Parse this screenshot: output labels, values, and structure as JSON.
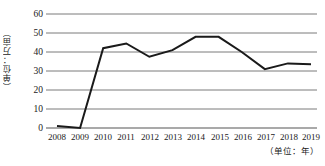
{
  "chart_data": {
    "type": "line",
    "title": "",
    "xlabel": "（单位：年）",
    "ylabel": "（单位：万亩）",
    "categories": [
      "2008",
      "2009",
      "2010",
      "2011",
      "2012",
      "2013",
      "2014",
      "2015",
      "2016",
      "2017",
      "2018",
      "2019"
    ],
    "values": [
      1,
      0,
      42,
      44.5,
      37.5,
      41,
      48,
      48,
      40,
      31,
      34,
      33.5
    ],
    "series": [
      {
        "name": "面积",
        "values": [
          1,
          0,
          42,
          44.5,
          37.5,
          41,
          48,
          48,
          40,
          31,
          34,
          33.5
        ]
      }
    ],
    "ylim": [
      0,
      60
    ],
    "y_ticks": [
      "0",
      "10",
      "20",
      "30",
      "40",
      "50",
      "60"
    ],
    "y_tick_values": [
      0,
      10,
      20,
      30,
      40,
      50,
      60
    ],
    "grid": true,
    "legend": "none",
    "line_color": "#1a1a1a",
    "grid_color": "#7a7a7a"
  }
}
